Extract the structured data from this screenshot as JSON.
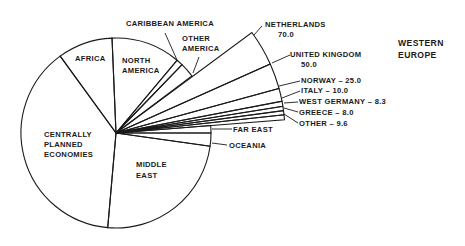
{
  "chart_data": {
    "type": "pie",
    "title": "",
    "center": [
      116,
      133
    ],
    "radius": 95,
    "exploded_radius": 169,
    "slices": [
      {
        "label": "FAR EAST",
        "start_deg": 4.5,
        "end_deg": 0
      },
      {
        "label": "OCEANIA",
        "start_deg": 0,
        "end_deg": -8
      },
      {
        "label": "MIDDLE EAST",
        "start_deg": -8,
        "end_deg": -95
      },
      {
        "label": "CENTRALLY PLANNED ECONOMIES",
        "start_deg": -95,
        "end_deg": -234
      },
      {
        "label": "AFRICA",
        "start_deg": 126,
        "end_deg": 92.4
      },
      {
        "label": "NORTH AMERICA",
        "start_deg": 92.4,
        "end_deg": 50
      },
      {
        "label": "CARIBBEAN AMERICA",
        "start_deg": 50,
        "end_deg": 46
      },
      {
        "label": "OTHER AMERICA",
        "start_deg": 46,
        "end_deg": 37
      }
    ],
    "group": {
      "label": "WESTERN EUROPE",
      "start_deg": 36.5,
      "end_deg": 4.5,
      "slices": [
        {
          "label": "NETHERLANDS",
          "value": 70.0
        },
        {
          "label": "UNITED KINGDOM",
          "value": 50.0
        },
        {
          "label": "NORWAY",
          "value": 25.0
        },
        {
          "label": "ITALY",
          "value": 10.0
        },
        {
          "label": "WEST GERMANY",
          "value": 8.3
        },
        {
          "label": "GREECE",
          "value": 8.0
        },
        {
          "label": "OTHER",
          "value": 9.6
        }
      ]
    }
  },
  "labels": {
    "caribbean": "CARIBBEAN AMERICA",
    "other_america_1": "OTHER",
    "other_america_2": "AMERICA",
    "africa": "AFRICA",
    "north_america_1": "NORTH",
    "north_america_2": "AMERICA",
    "centrally_1": "CENTRALLY",
    "centrally_2": "PLANNED",
    "centrally_3": "ECONOMIES",
    "middle_east_1": "MIDDLE",
    "middle_east_2": "EAST",
    "far_east": "FAR EAST",
    "oceania": "OCEANIA",
    "western_europe_1": "WESTERN",
    "western_europe_2": "EUROPE",
    "netherlands": "NETHERLANDS",
    "netherlands_value": "70.0",
    "uk": "UNITED KINGDOM",
    "uk_value": "50.0",
    "norway": "NORWAY  – 25.0",
    "italy": "ITALY – 10.0",
    "west_germany": "WEST GERMANY – 8.3",
    "greece": "GREECE – 8.0",
    "other": "OTHER – 9.6"
  }
}
